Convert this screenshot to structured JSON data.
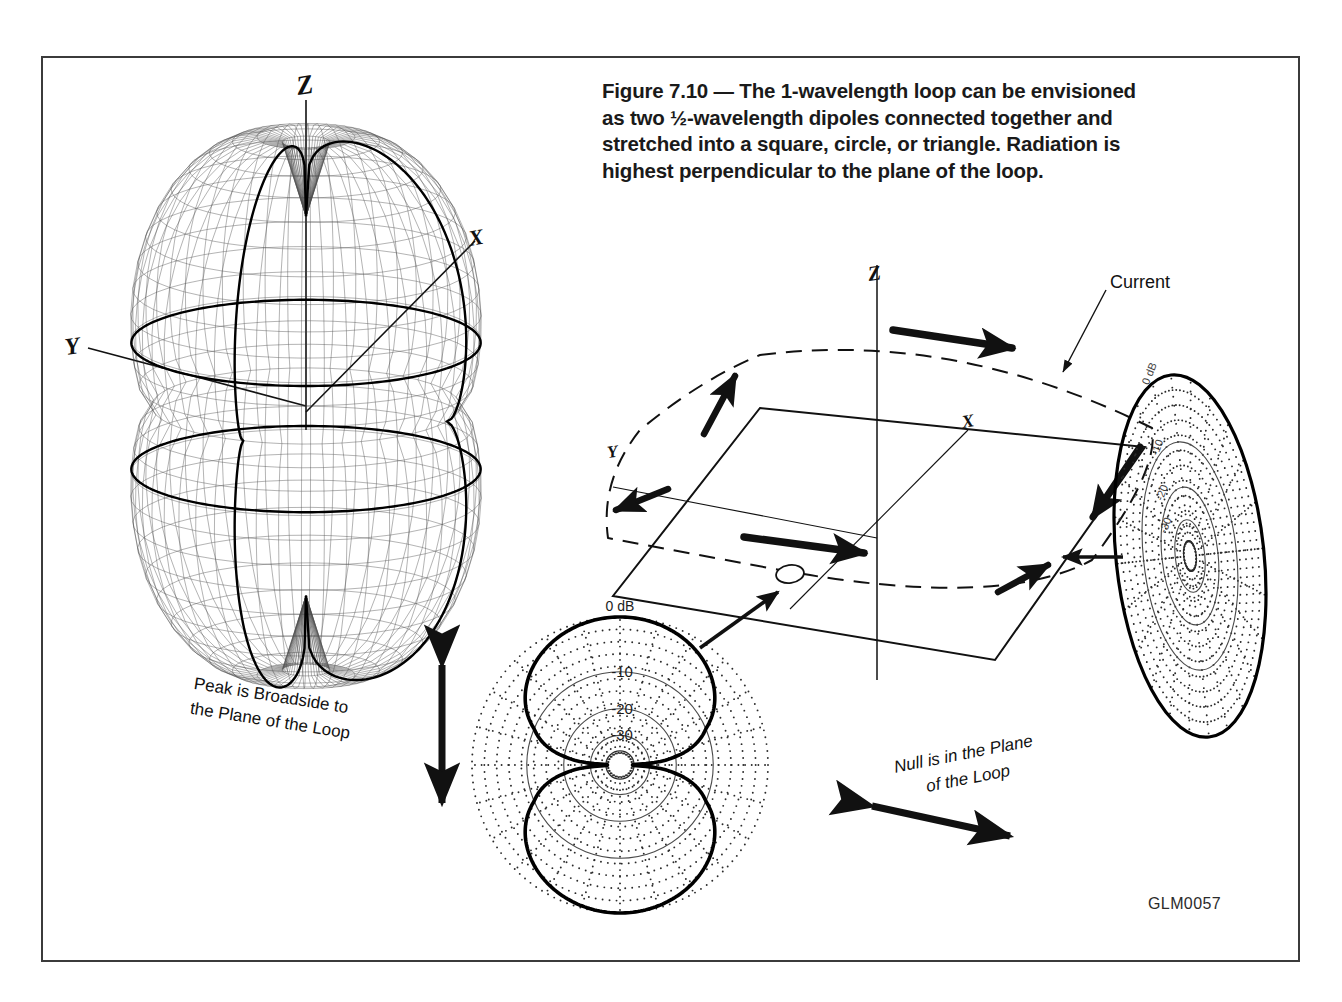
{
  "figure": {
    "caption": "Figure 7.10 — The 1-wavelength loop can be envisioned as two ½-wavelength dipoles connected together and stretched into a square, circle, or triangle. Radiation is highest perpendicular to the plane of the loop.",
    "id_tag": "GLM0057",
    "frame_color": "#3b3b3b",
    "background": "#ffffff",
    "ink_color": "#111111"
  },
  "pattern3d": {
    "name": "3D radiation pattern of 1-wavelength loop",
    "axes": {
      "z": "Z",
      "x": "X",
      "y": "Y"
    },
    "shape": "barrel / torus-like solid of revolution about Z",
    "nulls_at": "poles along Z axis",
    "mesh_color": "#3a3a3a"
  },
  "loop_diagram": {
    "name": "1-wavelength loop geometry",
    "axes": {
      "z": "Z",
      "x": "X",
      "y": "Y"
    },
    "current_label": "Current",
    "feed_point": "feed gap at front edge of loop",
    "wire_style": "dashed",
    "plane_style": "solid parallelogram"
  },
  "annotations": {
    "peak": "Peak is Broadside to\nthe Plane of the Loop",
    "null": "Null is in the Plane\nof the Loop"
  },
  "chart_data": [
    {
      "id": "elevation-pattern",
      "type": "polar",
      "title": "Elevation plane pattern (plane containing the loop axis)",
      "position": "bottom-center",
      "ring_labels": [
        "0 dB",
        "-10",
        "-20",
        "-30"
      ],
      "ring_values_db": [
        0,
        -10,
        -20,
        -30
      ],
      "ring_radii_fraction": [
        1.0,
        0.63,
        0.38,
        0.2
      ],
      "scale": "modified log, 40 dB full scale",
      "lobes": 2,
      "lobe_axis_deg": 90,
      "null_directions_deg": [
        0,
        180
      ],
      "peak_directions_deg": [
        90,
        270
      ],
      "grid": "dotted radial and concentric",
      "angles": [
        0,
        15,
        30,
        45,
        60,
        75,
        90,
        105,
        120,
        135,
        150,
        165,
        180,
        195,
        210,
        225,
        240,
        255,
        270,
        285,
        300,
        315,
        330,
        345
      ],
      "values_db": [
        -40,
        -26,
        -17,
        -10.5,
        -5.5,
        -2,
        0,
        -2,
        -5.5,
        -10.5,
        -17,
        -26,
        -40,
        -26,
        -17,
        -10.5,
        -5.5,
        -2,
        0,
        -2,
        -5.5,
        -10.5,
        -17,
        -26
      ],
      "description": "Figure-eight, two broad lobes with deep nulls in the plane of the loop"
    },
    {
      "id": "azimuth-pattern",
      "type": "polar",
      "title": "Azimuth plane pattern (plane of the loop, viewed in perspective)",
      "position": "right",
      "ring_labels": [
        "0 dB",
        "-10",
        "-20",
        "-30"
      ],
      "ring_values_db": [
        0,
        -10,
        -20,
        -30
      ],
      "ring_radii_fraction": [
        1.0,
        0.63,
        0.38,
        0.2
      ],
      "scale": "modified log, 40 dB full scale",
      "lobes": 1,
      "grid": "dotted radial and concentric",
      "angles": [
        0,
        30,
        60,
        90,
        120,
        150,
        180,
        210,
        240,
        270,
        300,
        330
      ],
      "values_db": [
        0,
        0,
        0,
        0,
        0,
        0,
        0,
        0,
        0,
        0,
        0,
        0
      ],
      "description": "Omnidirectional circular pattern shown as a tilted ellipse in perspective"
    }
  ]
}
